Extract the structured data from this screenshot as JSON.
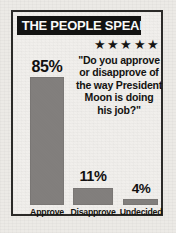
{
  "banner": {
    "title": "THE PEOPLE SPEAK"
  },
  "rating": {
    "stars_icon": "five-stars",
    "stars": "★★★★★",
    "count": 5
  },
  "question": {
    "lines": [
      "\"Do you approve",
      "or disapprove of",
      "the way President",
      "Moon is doing",
      "his job?\""
    ]
  },
  "chart_data": {
    "type": "bar",
    "title": "THE PEOPLE SPEAK",
    "question": "\"Do you approve or disapprove of the way President Moon is doing his job?\"",
    "categories": [
      "Approve",
      "Disapprove",
      "Undecided"
    ],
    "values": [
      85,
      11,
      4
    ],
    "value_labels": [
      "85%",
      "11%",
      "4%"
    ],
    "unit": "percent",
    "xlabel": "",
    "ylabel": "",
    "ylim": [
      0,
      100
    ],
    "grid": false,
    "legend": "none",
    "bar_color": "#827f7d",
    "text_color": "#131210",
    "background_color": "#f1efec"
  }
}
